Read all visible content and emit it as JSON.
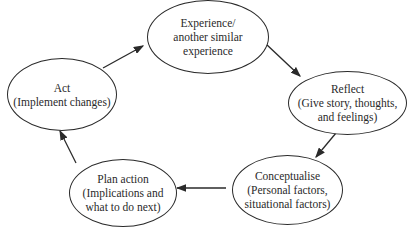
{
  "diagram": {
    "type": "cycle",
    "nodes": [
      {
        "id": "experience",
        "lines": [
          "Experience/",
          "another similar",
          "experience"
        ]
      },
      {
        "id": "reflect",
        "lines": [
          "Reflect",
          "(Give story, thoughts,",
          "and feelings)"
        ]
      },
      {
        "id": "conceptualise",
        "lines": [
          "Conceptualise",
          "(Personal factors,",
          "situational factors)"
        ]
      },
      {
        "id": "plan",
        "lines": [
          "Plan action",
          "(Implications and",
          "what to do next)"
        ]
      },
      {
        "id": "act",
        "lines": [
          "Act",
          "(Implement changes)"
        ]
      }
    ],
    "edges": [
      {
        "from": "experience",
        "to": "reflect"
      },
      {
        "from": "reflect",
        "to": "conceptualise"
      },
      {
        "from": "conceptualise",
        "to": "plan"
      },
      {
        "from": "plan",
        "to": "act"
      },
      {
        "from": "act",
        "to": "experience"
      }
    ],
    "colors": {
      "stroke": "#2a2a2a",
      "background": "#ffffff"
    }
  }
}
